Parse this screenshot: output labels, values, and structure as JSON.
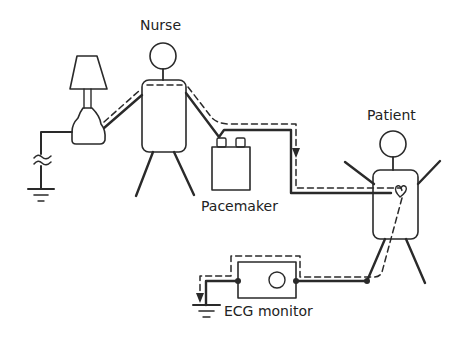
{
  "diagram": {
    "labels": {
      "nurse": "Nurse",
      "patient": "Patient",
      "pacemaker": "Pacemaker",
      "ecg_monitor": "ECG monitor"
    },
    "components": [
      {
        "id": "lamp",
        "type": "lamp"
      },
      {
        "id": "nurse",
        "type": "person"
      },
      {
        "id": "pacemaker",
        "type": "device"
      },
      {
        "id": "patient",
        "type": "person",
        "feature": "heart"
      },
      {
        "id": "ecg-monitor",
        "type": "device"
      },
      {
        "id": "ground-left",
        "type": "ground-with-capacitive-coupling"
      },
      {
        "id": "ground-ecg",
        "type": "ground"
      }
    ],
    "legend": {
      "solid_line": "conductive path",
      "dashed_line": "current flow path"
    },
    "colors": {
      "stroke": "#2a2a2a",
      "background": "#ffffff"
    }
  }
}
